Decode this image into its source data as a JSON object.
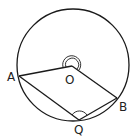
{
  "diagram": {
    "type": "circle-geometry",
    "colors": {
      "stroke": "#1a1a1a",
      "background": "#ffffff",
      "label": "#222222"
    },
    "circle": {
      "cx": 73,
      "cy": 65,
      "r": 56
    },
    "points": {
      "A": {
        "label": "A",
        "x": 19,
        "y": 76,
        "label_x": 7,
        "label_y": 81
      },
      "O": {
        "label": "O",
        "x": 72,
        "y": 66,
        "label_x": 65,
        "label_y": 84
      },
      "B": {
        "label": "B",
        "x": 117,
        "y": 98,
        "label_x": 119,
        "label_y": 111
      },
      "Q": {
        "label": "Q",
        "x": 79,
        "y": 120,
        "label_x": 74,
        "label_y": 134
      }
    },
    "segments": [
      "AO",
      "OB",
      "AQ",
      "QB"
    ],
    "angle_marks": [
      {
        "vertex": "O",
        "type": "double-arc",
        "description": "reflex angle AOB"
      },
      {
        "vertex": "Q",
        "type": "single-arc",
        "description": "angle AQB"
      }
    ]
  }
}
